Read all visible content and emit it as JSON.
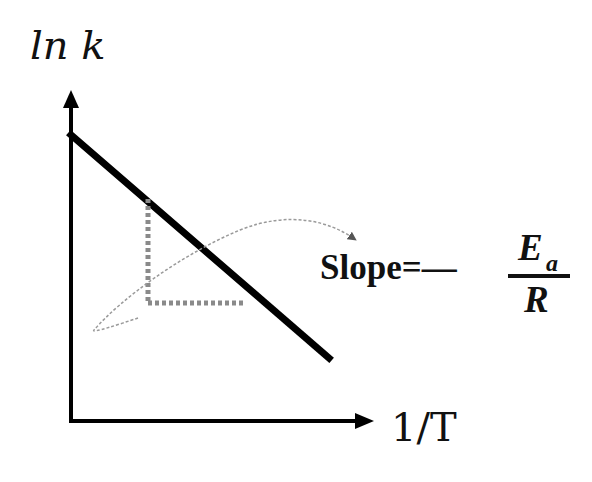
{
  "diagram": {
    "type": "arrhenius-plot",
    "y_axis_label": "ln k",
    "x_axis_label": "1/T",
    "slope_label": "Slope=—",
    "fraction": {
      "numerator": "E",
      "numerator_subscript": "a",
      "denominator": "R"
    },
    "colors": {
      "line": "#000000",
      "axes": "#000000",
      "dotted_triangle": "#888888",
      "curved_arrow": "#999999",
      "text": "#111111"
    }
  }
}
